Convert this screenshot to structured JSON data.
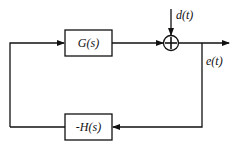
{
  "diagram": {
    "type": "feedback block diagram",
    "blocks": {
      "forward": {
        "label": "G(s)"
      },
      "feedback": {
        "label": "-H(s)"
      }
    },
    "summing_junction": {
      "symbol": "+"
    },
    "signals": {
      "disturbance": "d(t)",
      "output": "e(t)"
    }
  }
}
